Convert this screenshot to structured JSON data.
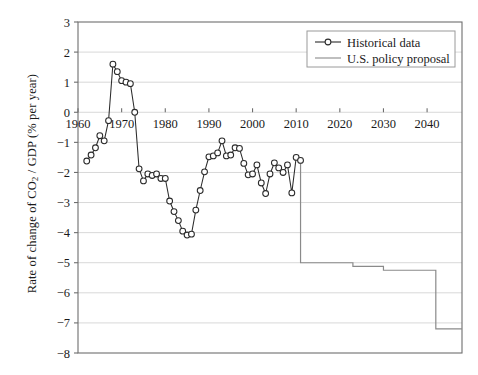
{
  "chart_data": {
    "type": "line",
    "title": "",
    "xlabel": "",
    "ylabel": "Rate of change of CO2 / GDP (% per year)",
    "ylabel_parts": {
      "pre": "Rate of change of CO",
      "sub": "2",
      "post": " / GDP (% per year)"
    },
    "xlim": [
      1960,
      2048
    ],
    "ylim": [
      -8,
      3
    ],
    "xticks": [
      1960,
      1970,
      1980,
      1990,
      2000,
      2010,
      2020,
      2030,
      2040
    ],
    "yticks": [
      3,
      2,
      1,
      0,
      -1,
      -2,
      -3,
      -4,
      -5,
      -6,
      -7,
      -8
    ],
    "ytick_labels": [
      "3",
      "2",
      "1",
      "0",
      "−1",
      "−2",
      "−3",
      "−4",
      "−5",
      "−6",
      "−7",
      "−8"
    ],
    "xtick_labels": [
      "1960",
      "1970",
      "1980",
      "1990",
      "2000",
      "2010",
      "2020",
      "2030",
      "2040"
    ],
    "grid": "horizontal",
    "legend_position": "top-right",
    "series": [
      {
        "name": "Historical data",
        "marker": "open-circle",
        "color": "#2b2b2b",
        "x": [
          1962,
          1963,
          1964,
          1965,
          1966,
          1967,
          1968,
          1969,
          1970,
          1971,
          1972,
          1973,
          1974,
          1975,
          1976,
          1977,
          1978,
          1979,
          1980,
          1981,
          1982,
          1983,
          1984,
          1985,
          1986,
          1987,
          1988,
          1989,
          1990,
          1991,
          1992,
          1993,
          1994,
          1995,
          1996,
          1997,
          1998,
          1999,
          2000,
          2001,
          2002,
          2003,
          2004,
          2005,
          2006,
          2007,
          2008,
          2009,
          2010,
          2011
        ],
        "y": [
          -1.62,
          -1.42,
          -1.18,
          -0.78,
          -0.95,
          -0.28,
          1.6,
          1.35,
          1.05,
          1.0,
          0.95,
          0.0,
          -1.88,
          -2.28,
          -2.05,
          -2.1,
          -2.05,
          -2.2,
          -2.2,
          -2.95,
          -3.3,
          -3.6,
          -3.95,
          -4.08,
          -4.05,
          -3.25,
          -2.6,
          -1.98,
          -1.48,
          -1.45,
          -1.35,
          -0.95,
          -1.45,
          -1.42,
          -1.18,
          -1.2,
          -1.7,
          -2.08,
          -2.05,
          -1.75,
          -2.35,
          -2.7,
          -2.05,
          -1.68,
          -1.85,
          -2.0,
          -1.75,
          -2.68,
          -1.5,
          -1.6
        ]
      },
      {
        "name": "U.S. policy proposal",
        "marker": "none",
        "color": "#8a8a8a",
        "step": true,
        "x": [
          2011,
          2011,
          2012,
          2023,
          2023,
          2030,
          2030,
          2042,
          2042,
          2048
        ],
        "y": [
          -1.6,
          -5.0,
          -5.0,
          -5.0,
          -5.12,
          -5.12,
          -5.25,
          -5.25,
          -7.2,
          -7.2
        ]
      }
    ],
    "legend": [
      {
        "label": "Historical data",
        "marker": "open-circle",
        "color": "#2b2b2b"
      },
      {
        "label": "U.S. policy proposal",
        "marker": "none",
        "color": "#8a8a8a"
      }
    ]
  },
  "colors": {
    "axis": "#6e6e6e",
    "grid": "#d8d8d8",
    "historical": "#2b2b2b",
    "policy": "#8a8a8a",
    "text": "#1a1a1a",
    "background": "#ffffff"
  }
}
